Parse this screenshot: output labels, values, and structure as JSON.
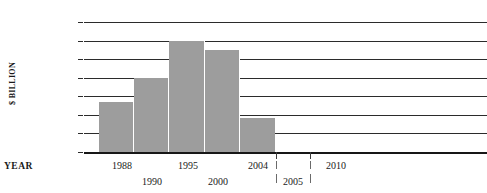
{
  "figure": {
    "title_sliver": "— —— —— ———",
    "ylabel": "$ BILLION",
    "xaxis_title": "YEAR"
  },
  "chart_data": {
    "type": "bar",
    "title": "",
    "xlabel": "YEAR",
    "ylabel": "$ BILLION",
    "ylim": [
      0,
      175
    ],
    "yticks": [
      0,
      25,
      50,
      75,
      100,
      125,
      150,
      175
    ],
    "ytick_labels": [
      "0",
      "25",
      "50",
      "75",
      "100",
      "125",
      "150",
      "175"
    ],
    "grid": true,
    "legend": "none",
    "categories": [
      "1988",
      "1990",
      "1995",
      "2000",
      "2004"
    ],
    "values": [
      68,
      100,
      150,
      137,
      46
    ],
    "bars": [
      {
        "label": "1988",
        "value": 68
      },
      {
        "label": "1990",
        "value": 100
      },
      {
        "label": "1995",
        "value": 150
      },
      {
        "label": "2000",
        "value": 137
      },
      {
        "label": "2004",
        "value": 46
      }
    ],
    "xtick_labels_top": [
      "1988",
      "1995",
      "2004",
      "2010"
    ],
    "xtick_labels_bottom": [
      "1990",
      "2000",
      "2005"
    ],
    "bar_color": "#9d9d9d",
    "gridline_color": "#2b2b2b"
  },
  "yticks": [
    {
      "label": "175",
      "value": 175
    },
    {
      "label": "150",
      "value": 150
    },
    {
      "label": "125",
      "value": 125
    },
    {
      "label": "100",
      "value": 100
    },
    {
      "label": "75",
      "value": 75
    },
    {
      "label": "50",
      "value": 50
    },
    {
      "label": "25",
      "value": 25
    },
    {
      "label": "0",
      "value": 0
    }
  ],
  "xlabels": [
    {
      "text": "1988",
      "row": "top",
      "x": 122
    },
    {
      "text": "1990",
      "row": "bottom",
      "x": 152
    },
    {
      "text": "1995",
      "row": "top",
      "x": 188
    },
    {
      "text": "2000",
      "row": "bottom",
      "x": 218
    },
    {
      "text": "2004",
      "row": "top",
      "x": 258
    },
    {
      "text": "2005",
      "row": "bottom",
      "x": 293
    },
    {
      "text": "2010",
      "row": "top",
      "x": 336
    }
  ]
}
